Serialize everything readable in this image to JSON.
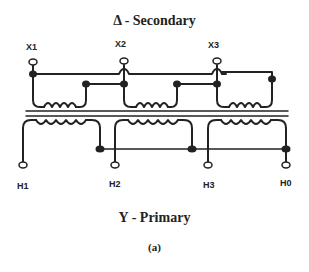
{
  "diagram": {
    "secondary_title": "Δ - Secondary",
    "primary_title": "Y - Primary",
    "caption": "(a)",
    "secondary_terminals": [
      "X1",
      "X2",
      "X3"
    ],
    "primary_terminals": [
      "H1",
      "H2",
      "H3",
      "H0"
    ],
    "colors": {
      "line": "#222222",
      "background": "#ffffff"
    }
  }
}
